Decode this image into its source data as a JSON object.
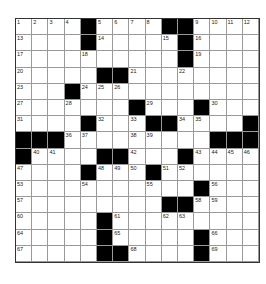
{
  "puzzle": {
    "size": 15,
    "rows": [
      [
        "1",
        "2",
        "3",
        "4",
        "#",
        "5",
        "6",
        "7",
        "8",
        "#",
        "#",
        "9",
        "10",
        "11",
        "12"
      ],
      [
        "13",
        "",
        "",
        "",
        "#",
        "14",
        "",
        "",
        "",
        "15",
        "#",
        "16",
        "",
        "",
        ""
      ],
      [
        "17",
        "",
        "",
        "",
        "18",
        "",
        "",
        "",
        "",
        "",
        "#",
        "19",
        "",
        "",
        ""
      ],
      [
        "20",
        "",
        "",
        "",
        "",
        "#",
        "#",
        "21",
        "",
        "",
        "22",
        "",
        "",
        "",
        ""
      ],
      [
        "23",
        "",
        "",
        "#",
        "24",
        "25",
        "26",
        "",
        "",
        "",
        "",
        "",
        "",
        "",
        ""
      ],
      [
        "27",
        "",
        "",
        "28",
        "",
        "",
        "",
        "#",
        "29",
        "",
        "",
        "#",
        "30",
        "",
        ""
      ],
      [
        "31",
        "",
        "",
        "",
        "#",
        "32",
        "",
        "33",
        "#",
        "#",
        "34",
        "35",
        "",
        "",
        "#"
      ],
      [
        "#",
        "#",
        "#",
        "36",
        "37",
        "",
        "",
        "38",
        "39",
        "",
        "",
        "",
        "#",
        "#",
        "#"
      ],
      [
        "#",
        "40",
        "41",
        "",
        "",
        "#",
        "#",
        "42",
        "",
        "",
        "#",
        "43",
        "44",
        "45",
        "46"
      ],
      [
        "47",
        "",
        "",
        "",
        "#",
        "48",
        "49",
        "50",
        "#",
        "51",
        "52",
        "",
        "",
        "",
        ""
      ],
      [
        "53",
        "",
        "",
        "",
        "54",
        "",
        "",
        "",
        "55",
        "",
        "",
        "#",
        "56",
        "",
        ""
      ],
      [
        "57",
        "",
        "",
        "",
        "",
        "",
        "",
        "",
        "",
        "#",
        "#",
        "58",
        "59",
        "",
        ""
      ],
      [
        "60",
        "",
        "",
        "",
        "",
        "#",
        "61",
        "",
        "",
        "62",
        "63",
        "",
        "",
        "",
        ""
      ],
      [
        "64",
        "",
        "",
        "",
        "",
        "#",
        "65",
        "",
        "",
        "",
        "",
        "#",
        "66",
        "",
        ""
      ],
      [
        "67",
        "",
        "",
        "",
        "",
        "#",
        "#",
        "68",
        "",
        "",
        "",
        "#",
        "69",
        "",
        ""
      ]
    ]
  }
}
